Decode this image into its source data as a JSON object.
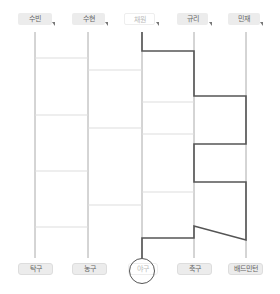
{
  "players": [
    {
      "label": "수빈",
      "selected": false
    },
    {
      "label": "수현",
      "selected": false
    },
    {
      "label": "채원",
      "selected": true
    },
    {
      "label": "규리",
      "selected": false
    },
    {
      "label": "민재",
      "selected": false
    }
  ],
  "results": [
    {
      "label": "탁구",
      "selected": false
    },
    {
      "label": "농구",
      "selected": false
    },
    {
      "label": "야구",
      "selected": true
    },
    {
      "label": "축구",
      "selected": false
    },
    {
      "label": "배드민턴",
      "selected": false
    }
  ],
  "colors": {
    "rail": "#aaaaaa",
    "rung": "#dddddd",
    "path": "#555555",
    "label_bg": "#ececec"
  }
}
